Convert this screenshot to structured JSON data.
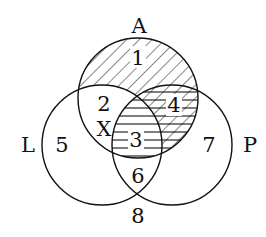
{
  "diagram": {
    "type": "venn",
    "sets": [
      {
        "name": "A",
        "label": "A"
      },
      {
        "name": "L",
        "label": "L"
      },
      {
        "name": "P",
        "label": "P"
      }
    ],
    "regions": [
      {
        "label": "1",
        "description": "A only",
        "hatch": "diagonal"
      },
      {
        "label": "2",
        "description": "A and L only",
        "hatch": "none"
      },
      {
        "label": "3",
        "description": "A, L and P",
        "hatch": "horizontal"
      },
      {
        "label": "4",
        "description": "A and P only",
        "hatch": "diagonal+horizontal"
      },
      {
        "label": "5",
        "description": "L only",
        "hatch": "none"
      },
      {
        "label": "6",
        "description": "L and P only",
        "hatch": "none"
      },
      {
        "label": "7",
        "description": "P only",
        "hatch": "none"
      },
      {
        "label": "8",
        "description": "outside all",
        "hatch": "none"
      }
    ],
    "marker": "X",
    "colors": {
      "stroke": "#111111",
      "background": "#ffffff"
    }
  }
}
